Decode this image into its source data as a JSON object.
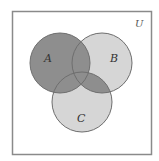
{
  "diagram": {
    "type": "venn",
    "universe_label": "U",
    "sets": [
      {
        "name": "A",
        "label": "A",
        "cx": 60,
        "cy": 63,
        "r": 30
      },
      {
        "name": "B",
        "label": "B",
        "cx": 102,
        "cy": 63,
        "r": 30
      },
      {
        "name": "C",
        "label": "C",
        "cx": 82,
        "cy": 102,
        "r": 30
      }
    ],
    "shaded_region": "A ∪ (B ∩ C)",
    "colors": {
      "background": "#ffffff",
      "border": "#8a8a8a",
      "unshaded_fill": "#d6d6d6",
      "shaded_fill": "#8e8e8e",
      "circle_stroke": "#6e6e6e"
    }
  }
}
